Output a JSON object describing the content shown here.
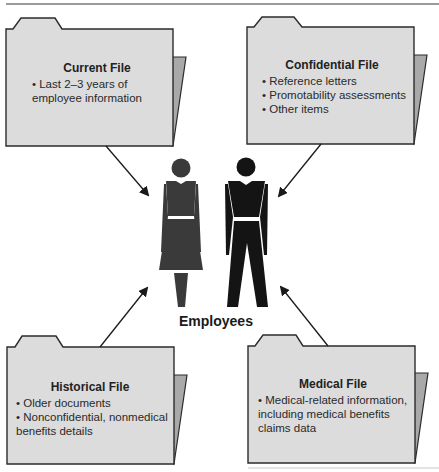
{
  "colors": {
    "folder_front": "#dcdcdc",
    "folder_back": "#a9a9a9",
    "outline": "#2b2b2b",
    "woman": "#3a3a3a",
    "man": "#141414",
    "rule_top": "#7a7a7a",
    "rule_bottom": "#b8b8b8"
  },
  "center": {
    "label": "Employees"
  },
  "folders": [
    {
      "id": "current",
      "title": "Current File",
      "lines": [
        "• Last 2–3 years of",
        "employee information"
      ]
    },
    {
      "id": "confidential",
      "title": "Confidential File",
      "lines": [
        "• Reference letters",
        "• Promotability assessments",
        "• Other items"
      ]
    },
    {
      "id": "historical",
      "title": "Historical File",
      "lines": [
        "• Older documents",
        "• Nonconfidential, nonmedical",
        "benefits details"
      ]
    },
    {
      "id": "medical",
      "title": "Medical File",
      "lines": [
        "• Medical-related information,",
        "including medical benefits",
        "claims data"
      ]
    }
  ],
  "icons": {
    "folder": "folder-icon",
    "woman": "woman-figure-icon",
    "man": "man-figure-icon",
    "arrow": "arrow-icon"
  }
}
